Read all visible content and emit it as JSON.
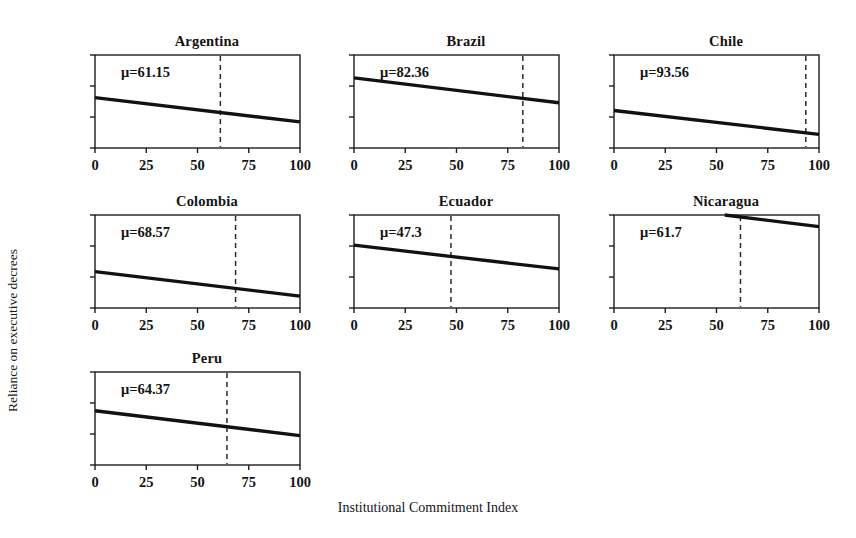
{
  "figure": {
    "xlabel": "Institutional Commitment Index",
    "ylabel": "Reliance on executive decrees"
  },
  "chart_data": {
    "type": "line",
    "title": "",
    "xlabel": "Institutional Commitment Index",
    "ylabel": "Reliance on executive decrees",
    "xlim": [
      0,
      100
    ],
    "ylim": [
      0.0,
      0.6
    ],
    "xticks": [
      0,
      25,
      50,
      75,
      100
    ],
    "xticklabels": [
      "0",
      "25",
      "50",
      "75",
      "100"
    ],
    "yticks": [
      0.0,
      0.2,
      0.4,
      0.6
    ],
    "yticklabels": [
      "0.0",
      "0.2",
      "0.4",
      "0.6"
    ],
    "grid": false,
    "legend": null,
    "layout": "small-multiples 3 columns x 3 rows (7 panels)",
    "panels": [
      {
        "title": "Argentina",
        "annotation": "μ=61.15",
        "mean_x": 61.15,
        "x": [
          0,
          100
        ],
        "y": [
          0.325,
          0.168
        ],
        "row": 0,
        "col": 0
      },
      {
        "title": "Brazil",
        "annotation": "μ=82.36",
        "mean_x": 82.36,
        "x": [
          0,
          100
        ],
        "y": [
          0.452,
          0.292
        ],
        "row": 0,
        "col": 1
      },
      {
        "title": "Chile",
        "annotation": "μ=93.56",
        "mean_x": 93.56,
        "x": [
          0,
          100
        ],
        "y": [
          0.242,
          0.088
        ],
        "row": 0,
        "col": 2
      },
      {
        "title": "Colombia",
        "annotation": "μ=68.57",
        "mean_x": 68.57,
        "x": [
          0,
          100
        ],
        "y": [
          0.235,
          0.076
        ],
        "row": 1,
        "col": 0
      },
      {
        "title": "Ecuador",
        "annotation": "μ=47.3",
        "mean_x": 47.3,
        "x": [
          0,
          100
        ],
        "y": [
          0.405,
          0.252
        ],
        "row": 1,
        "col": 1
      },
      {
        "title": "Nicaragua",
        "annotation": "μ=61.7",
        "mean_x": 61.7,
        "x": [
          54,
          100
        ],
        "y": [
          0.6,
          0.525
        ],
        "row": 1,
        "col": 2
      },
      {
        "title": "Peru",
        "annotation": "μ=64.37",
        "mean_x": 64.37,
        "x": [
          0,
          100
        ],
        "y": [
          0.35,
          0.19
        ],
        "row": 2,
        "col": 0
      }
    ]
  }
}
